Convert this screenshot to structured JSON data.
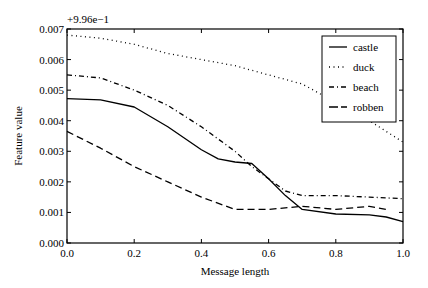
{
  "chart_data": {
    "type": "line",
    "title": "",
    "offset_label": "+9.96e−1",
    "xlabel": "Message length",
    "ylabel": "Feature value",
    "xlim": [
      0.0,
      1.0
    ],
    "ylim": [
      0.0,
      0.007
    ],
    "xticks": [
      "0.0",
      "0.2",
      "0.4",
      "0.6",
      "0.8",
      "1.0"
    ],
    "yticks": [
      "0.000",
      "0.001",
      "0.002",
      "0.003",
      "0.004",
      "0.005",
      "0.006",
      "0.007"
    ],
    "grid": false,
    "legend_position": "upper right",
    "series": [
      {
        "name": "castle",
        "style": "solid",
        "x": [
          0.0,
          0.1,
          0.2,
          0.3,
          0.4,
          0.45,
          0.5,
          0.55,
          0.6,
          0.65,
          0.7,
          0.8,
          0.9,
          0.95,
          1.0
        ],
        "values": [
          0.00472,
          0.00468,
          0.00445,
          0.0038,
          0.00305,
          0.00275,
          0.00265,
          0.0026,
          0.0021,
          0.00155,
          0.0011,
          0.00095,
          0.00092,
          0.00085,
          0.0007
        ]
      },
      {
        "name": "duck",
        "style": "dotted",
        "x": [
          0.0,
          0.1,
          0.2,
          0.3,
          0.4,
          0.5,
          0.6,
          0.7,
          0.8,
          0.9,
          1.0
        ],
        "values": [
          0.0068,
          0.0067,
          0.0065,
          0.0062,
          0.006,
          0.0058,
          0.0055,
          0.0052,
          0.0046,
          0.004,
          0.0033
        ]
      },
      {
        "name": "beach",
        "style": "dashdot",
        "x": [
          0.0,
          0.1,
          0.2,
          0.3,
          0.4,
          0.5,
          0.55,
          0.6,
          0.65,
          0.7,
          0.8,
          0.9,
          1.0
        ],
        "values": [
          0.0055,
          0.0054,
          0.005,
          0.0045,
          0.0038,
          0.003,
          0.0025,
          0.0021,
          0.0017,
          0.00155,
          0.00155,
          0.0015,
          0.00145
        ]
      },
      {
        "name": "robben",
        "style": "dashed",
        "x": [
          0.0,
          0.1,
          0.2,
          0.3,
          0.4,
          0.5,
          0.6,
          0.7,
          0.8,
          0.9,
          0.95
        ],
        "values": [
          0.00365,
          0.0031,
          0.0025,
          0.002,
          0.0015,
          0.0011,
          0.0011,
          0.0012,
          0.0011,
          0.0012,
          0.0011
        ]
      }
    ]
  }
}
